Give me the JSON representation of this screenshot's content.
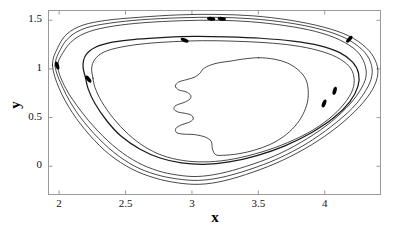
{
  "chart_data": {
    "type": "line",
    "title": "",
    "subtitle": "",
    "xlabel": "x",
    "ylabel": "y",
    "xlim": [
      1.92,
      4.42
    ],
    "ylim": [
      -0.29,
      1.6
    ],
    "xticks": [
      "2",
      "2.5",
      "3",
      "3.5",
      "4"
    ],
    "xtick_values": [
      2,
      2.5,
      3,
      3.5,
      4
    ],
    "yticks": [
      "0",
      "0.5",
      "1",
      "1.5"
    ],
    "ytick_values": [
      0,
      0.5,
      1,
      1.5
    ],
    "grid": false,
    "legend": "none",
    "frame": "box",
    "line_color": "#1a1a1a",
    "marker_color": "#000000",
    "background": "#ffffff",
    "series": [
      {
        "name": "outer-orbit-1",
        "width": 0.8,
        "closed": true,
        "points": [
          [
            1.95,
            1.04
          ],
          [
            1.99,
            1.22
          ],
          [
            2.06,
            1.36
          ],
          [
            2.18,
            1.45
          ],
          [
            2.36,
            1.5
          ],
          [
            2.6,
            1.53
          ],
          [
            2.9,
            1.555
          ],
          [
            3.18,
            1.56
          ],
          [
            3.46,
            1.545
          ],
          [
            3.74,
            1.5
          ],
          [
            3.99,
            1.43
          ],
          [
            4.18,
            1.34
          ],
          [
            4.31,
            1.22
          ],
          [
            4.38,
            1.09
          ],
          [
            4.4,
            0.95
          ],
          [
            4.36,
            0.79
          ],
          [
            4.26,
            0.61
          ],
          [
            4.1,
            0.41
          ],
          [
            3.9,
            0.22
          ],
          [
            3.68,
            0.06
          ],
          [
            3.46,
            -0.06
          ],
          [
            3.24,
            -0.15
          ],
          [
            3.06,
            -0.185
          ],
          [
            2.89,
            -0.17
          ],
          [
            2.72,
            -0.12
          ],
          [
            2.55,
            -0.03
          ],
          [
            2.38,
            0.12
          ],
          [
            2.23,
            0.32
          ],
          [
            2.1,
            0.55
          ],
          [
            2.0,
            0.8
          ],
          [
            1.95,
            1.04
          ]
        ]
      },
      {
        "name": "outer-orbit-2",
        "width": 0.8,
        "closed": true,
        "points": [
          [
            1.97,
            1.03
          ],
          [
            2.01,
            1.2
          ],
          [
            2.08,
            1.33
          ],
          [
            2.2,
            1.42
          ],
          [
            2.38,
            1.47
          ],
          [
            2.62,
            1.505
          ],
          [
            2.91,
            1.525
          ],
          [
            3.18,
            1.53
          ],
          [
            3.45,
            1.515
          ],
          [
            3.72,
            1.475
          ],
          [
            3.96,
            1.41
          ],
          [
            4.15,
            1.32
          ],
          [
            4.28,
            1.2
          ],
          [
            4.345,
            1.07
          ],
          [
            4.355,
            0.93
          ],
          [
            4.31,
            0.78
          ],
          [
            4.21,
            0.6
          ],
          [
            4.05,
            0.41
          ],
          [
            3.86,
            0.23
          ],
          [
            3.65,
            0.08
          ],
          [
            3.43,
            -0.035
          ],
          [
            3.22,
            -0.115
          ],
          [
            3.05,
            -0.145
          ],
          [
            2.89,
            -0.13
          ],
          [
            2.73,
            -0.085
          ],
          [
            2.57,
            0.0
          ],
          [
            2.41,
            0.145
          ],
          [
            2.26,
            0.34
          ],
          [
            2.13,
            0.56
          ],
          [
            2.03,
            0.8
          ],
          [
            1.97,
            1.03
          ]
        ]
      },
      {
        "name": "outer-orbit-3",
        "width": 0.8,
        "closed": true,
        "points": [
          [
            1.99,
            1.02
          ],
          [
            2.03,
            1.17
          ],
          [
            2.11,
            1.3
          ],
          [
            2.23,
            1.385
          ],
          [
            2.41,
            1.44
          ],
          [
            2.64,
            1.475
          ],
          [
            2.92,
            1.495
          ],
          [
            3.18,
            1.5
          ],
          [
            3.44,
            1.485
          ],
          [
            3.7,
            1.445
          ],
          [
            3.93,
            1.385
          ],
          [
            4.11,
            1.3
          ],
          [
            4.24,
            1.185
          ],
          [
            4.3,
            1.055
          ],
          [
            4.31,
            0.915
          ],
          [
            4.26,
            0.765
          ],
          [
            4.16,
            0.595
          ],
          [
            4.01,
            0.415
          ],
          [
            3.82,
            0.245
          ],
          [
            3.62,
            0.105
          ],
          [
            3.41,
            0.0
          ],
          [
            3.21,
            -0.075
          ],
          [
            3.04,
            -0.105
          ],
          [
            2.89,
            -0.09
          ],
          [
            2.74,
            -0.045
          ],
          [
            2.59,
            0.04
          ],
          [
            2.44,
            0.175
          ],
          [
            2.29,
            0.365
          ],
          [
            2.16,
            0.575
          ],
          [
            2.05,
            0.8
          ],
          [
            1.99,
            1.02
          ]
        ]
      },
      {
        "name": "mid-orbit-thick",
        "width": 1.25,
        "closed": true,
        "points": [
          [
            2.2,
            0.9
          ],
          [
            2.18,
            1.03
          ],
          [
            2.2,
            1.14
          ],
          [
            2.27,
            1.22
          ],
          [
            2.4,
            1.275
          ],
          [
            2.58,
            1.305
          ],
          [
            2.8,
            1.325
          ],
          [
            3.02,
            1.335
          ],
          [
            3.26,
            1.33
          ],
          [
            3.52,
            1.315
          ],
          [
            3.76,
            1.285
          ],
          [
            3.96,
            1.24
          ],
          [
            4.11,
            1.17
          ],
          [
            4.21,
            1.07
          ],
          [
            4.255,
            0.955
          ],
          [
            4.25,
            0.82
          ],
          [
            4.19,
            0.665
          ],
          [
            4.07,
            0.5
          ],
          [
            3.9,
            0.345
          ],
          [
            3.7,
            0.21
          ],
          [
            3.49,
            0.11
          ],
          [
            3.28,
            0.045
          ],
          [
            3.09,
            0.02
          ],
          [
            2.92,
            0.035
          ],
          [
            2.76,
            0.085
          ],
          [
            2.61,
            0.175
          ],
          [
            2.47,
            0.305
          ],
          [
            2.36,
            0.465
          ],
          [
            2.27,
            0.645
          ],
          [
            2.22,
            0.79
          ],
          [
            2.2,
            0.9
          ]
        ]
      },
      {
        "name": "inner-orbit-thin",
        "width": 0.8,
        "closed": true,
        "points": [
          [
            2.255,
            0.905
          ],
          [
            2.245,
            1.01
          ],
          [
            2.27,
            1.1
          ],
          [
            2.34,
            1.175
          ],
          [
            2.47,
            1.225
          ],
          [
            2.65,
            1.26
          ],
          [
            2.86,
            1.28
          ],
          [
            3.08,
            1.29
          ],
          [
            3.31,
            1.285
          ],
          [
            3.55,
            1.27
          ],
          [
            3.77,
            1.24
          ],
          [
            3.95,
            1.19
          ],
          [
            4.09,
            1.12
          ],
          [
            4.185,
            1.025
          ],
          [
            4.22,
            0.915
          ],
          [
            4.21,
            0.785
          ],
          [
            4.145,
            0.64
          ],
          [
            4.03,
            0.485
          ],
          [
            3.87,
            0.34
          ],
          [
            3.67,
            0.215
          ],
          [
            3.47,
            0.125
          ],
          [
            3.27,
            0.065
          ],
          [
            3.09,
            0.045
          ],
          [
            2.93,
            0.06
          ],
          [
            2.78,
            0.11
          ],
          [
            2.645,
            0.2
          ],
          [
            2.52,
            0.33
          ],
          [
            2.41,
            0.49
          ],
          [
            2.32,
            0.665
          ],
          [
            2.27,
            0.81
          ],
          [
            2.255,
            0.905
          ]
        ]
      },
      {
        "name": "inner-face-orbit",
        "width": 0.8,
        "closed": true,
        "points": [
          [
            3.5,
            1.115
          ],
          [
            3.62,
            1.1
          ],
          [
            3.72,
            1.06
          ],
          [
            3.8,
            0.99
          ],
          [
            3.855,
            0.9
          ],
          [
            3.875,
            0.79
          ],
          [
            3.87,
            0.66
          ],
          [
            3.835,
            0.53
          ],
          [
            3.775,
            0.41
          ],
          [
            3.69,
            0.305
          ],
          [
            3.59,
            0.225
          ],
          [
            3.47,
            0.165
          ],
          [
            3.35,
            0.128
          ],
          [
            3.24,
            0.113
          ],
          [
            3.18,
            0.118
          ],
          [
            3.155,
            0.175
          ],
          [
            3.145,
            0.255
          ],
          [
            3.1,
            0.3
          ],
          [
            3.02,
            0.325
          ],
          [
            2.94,
            0.33
          ],
          [
            2.885,
            0.345
          ],
          [
            2.88,
            0.39
          ],
          [
            2.92,
            0.425
          ],
          [
            2.975,
            0.45
          ],
          [
            3.01,
            0.485
          ],
          [
            2.995,
            0.525
          ],
          [
            2.945,
            0.545
          ],
          [
            2.9,
            0.555
          ],
          [
            2.865,
            0.585
          ],
          [
            2.88,
            0.625
          ],
          [
            2.94,
            0.655
          ],
          [
            2.985,
            0.69
          ],
          [
            2.99,
            0.73
          ],
          [
            2.955,
            0.765
          ],
          [
            2.9,
            0.785
          ],
          [
            2.875,
            0.825
          ],
          [
            2.9,
            0.865
          ],
          [
            2.96,
            0.89
          ],
          [
            3.02,
            0.915
          ],
          [
            3.06,
            0.955
          ],
          [
            3.085,
            1.0
          ],
          [
            3.14,
            1.04
          ],
          [
            3.21,
            1.065
          ],
          [
            3.29,
            1.08
          ],
          [
            3.38,
            1.1
          ],
          [
            3.5,
            1.115
          ]
        ]
      }
    ],
    "markers": [
      {
        "name": "marker-left-upper",
        "x": 1.985,
        "y": 1.035,
        "angle": 72
      },
      {
        "name": "marker-left-lower",
        "x": 2.22,
        "y": 0.895,
        "angle": 52
      },
      {
        "name": "marker-top-left-inner",
        "x": 2.945,
        "y": 1.295,
        "angle": 22
      },
      {
        "name": "marker-top-center-a",
        "x": 3.145,
        "y": 1.515,
        "angle": 6
      },
      {
        "name": "marker-top-center-b",
        "x": 3.225,
        "y": 1.515,
        "angle": 6
      },
      {
        "name": "marker-right-upper",
        "x": 4.185,
        "y": 1.305,
        "angle": -48
      },
      {
        "name": "marker-right-mid",
        "x": 4.075,
        "y": 0.775,
        "angle": -74
      },
      {
        "name": "marker-right-lower",
        "x": 3.995,
        "y": 0.645,
        "angle": -68
      }
    ]
  },
  "axes": {
    "x_label": "x",
    "y_label": "y"
  }
}
